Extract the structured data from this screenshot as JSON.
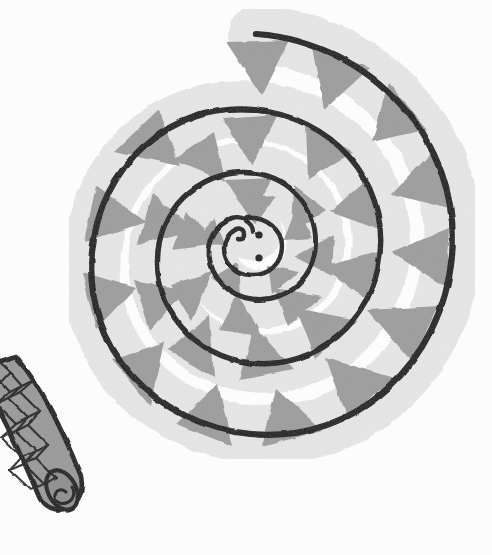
{
  "image": {
    "title": "Coiled snake illustration",
    "subject": "snake",
    "style": "hand-drawn ink and wash drawing",
    "width": 492,
    "height": 555,
    "background_color": "#fcfcfc"
  },
  "palette": {
    "background": "#fcfcfc",
    "outline": "#151515",
    "body_light": "#e6e6e6",
    "body_shadow": "#dcdcdc",
    "marking_gray": "#9d9d9d",
    "marking_gray_dark": "#8e8e8e",
    "tail_gray": "#9a9a9a",
    "eye_black": "#101010"
  },
  "subject": {
    "name": "coiled-snake",
    "description": "A snake drawn coiled into a flat spiral of roughly three and a half turns, viewed from above, with its small head at the center of the spiral and its tail extending out to the lower left beyond the coil.",
    "coil_center_x": 250,
    "coil_center_y": 252,
    "turns": 3.5,
    "outer_radius": 232,
    "band_width": 58
  },
  "parts": [
    {
      "name": "outer-coil",
      "label": "Outermost body coil"
    },
    {
      "name": "second-coil",
      "label": "Second body coil"
    },
    {
      "name": "third-coil",
      "label": "Third body coil"
    },
    {
      "name": "inner-coil",
      "label": "Innermost body coil"
    },
    {
      "name": "snake-head",
      "label": "Snake head at spiral centre"
    },
    {
      "name": "snake-tail",
      "label": "Cross-hatched tail at lower left"
    }
  ],
  "head": {
    "name": "snake-head",
    "center_x": 253,
    "center_y": 245,
    "radius": 28,
    "eyes": [
      {
        "name": "upper-eye-dot",
        "x": 259,
        "y": 235,
        "r": 3.6
      },
      {
        "name": "lower-eye-dot",
        "x": 259,
        "y": 258,
        "r": 3.6
      }
    ],
    "snout_hook": "small inward curl of the outline forming the snout at the left of the head"
  },
  "tail": {
    "name": "snake-tail",
    "description": "Tapered tail segment leaving the coil at the lower left, filled mid gray and covered with a crosshatched diamond scale pattern, ending in a rounded blunt tip bearing a small spiral mark.",
    "start_x": 0,
    "start_y": 372,
    "tip_x": 80,
    "tip_y": 512,
    "pattern": "crosshatch-diamonds",
    "tip_mark": "small coiled spiral on the blunt end"
  },
  "markings": {
    "name": "triangular-markings",
    "shape": "triangle",
    "fill": "#9d9d9d",
    "description": "Rows of roughly triangular gray blotches set along each coil, their apexes pointing inward toward the centre of the spiral.",
    "counts": {
      "outer_coil": 11,
      "second_coil": 9,
      "third_coil": 8,
      "inner_coil": 7
    }
  },
  "accessibility": {
    "alt_text": "Black and white drawing of a snake coiled in a tight spiral with triangular gray markings on its back, its head in the centre and its crosshatched tail trailing off to the lower left."
  }
}
